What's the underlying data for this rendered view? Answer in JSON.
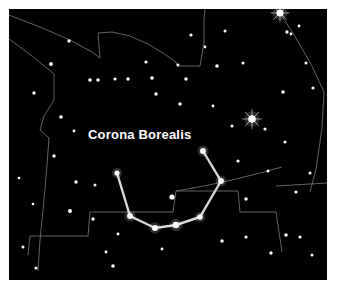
{
  "chart": {
    "title": "Corona Borealis",
    "type": "star-chart",
    "frame": {
      "background_color": "#ffffff",
      "sky_color": "#000000",
      "sky_left": 9,
      "sky_top": 9,
      "sky_width": 318,
      "sky_height": 271
    },
    "label": {
      "text": "Corona Borealis",
      "x": 88,
      "y": 128,
      "color": "#ffffff",
      "font_size": 13,
      "bold": true
    },
    "colors": {
      "star": "#ffffff",
      "constellation_line": "#d8d8d8",
      "boundary_line": "#6e6e6e",
      "sky": "#000000",
      "border": "#ffffff"
    },
    "constellation": {
      "name": "Corona Borealis",
      "line_color": "#d8d8d8",
      "line_width": 2.4,
      "stars": [
        {
          "name": "theta-crb",
          "x": 117,
          "y": 173,
          "r": 2.6
        },
        {
          "name": "beta-crb",
          "x": 130,
          "y": 216,
          "r": 2.9
        },
        {
          "name": "gamma-crb",
          "x": 155,
          "y": 228,
          "r": 3.0
        },
        {
          "name": "alpha-crb-alphecca",
          "x": 176,
          "y": 225,
          "r": 3.3
        },
        {
          "name": "delta-crb",
          "x": 200,
          "y": 217,
          "r": 2.8
        },
        {
          "name": "iota-crb",
          "x": 221,
          "y": 181,
          "r": 2.9
        },
        {
          "name": "epsilon-crb",
          "x": 203,
          "y": 151,
          "r": 2.9
        }
      ],
      "segments": [
        [
          0,
          1
        ],
        [
          1,
          2
        ],
        [
          2,
          3
        ],
        [
          3,
          4
        ],
        [
          4,
          5
        ],
        [
          5,
          6
        ]
      ]
    },
    "background_stars": [
      {
        "x": 280,
        "y": 13,
        "r": 3.6
      },
      {
        "x": 252,
        "y": 119,
        "r": 3.8
      },
      {
        "x": 172,
        "y": 197,
        "r": 2.6
      },
      {
        "x": 69,
        "y": 41,
        "r": 1.7
      },
      {
        "x": 191,
        "y": 35,
        "r": 1.6
      },
      {
        "x": 225,
        "y": 31,
        "r": 1.5
      },
      {
        "x": 205,
        "y": 47,
        "r": 1.4
      },
      {
        "x": 287,
        "y": 32,
        "r": 1.7
      },
      {
        "x": 299,
        "y": 26,
        "r": 1.4
      },
      {
        "x": 51,
        "y": 64,
        "r": 1.9
      },
      {
        "x": 90,
        "y": 80,
        "r": 1.8
      },
      {
        "x": 98,
        "y": 80,
        "r": 1.7
      },
      {
        "x": 115,
        "y": 79,
        "r": 1.6
      },
      {
        "x": 128,
        "y": 79,
        "r": 1.7
      },
      {
        "x": 146,
        "y": 62,
        "r": 1.6
      },
      {
        "x": 152,
        "y": 78,
        "r": 1.8
      },
      {
        "x": 156,
        "y": 94,
        "r": 1.7
      },
      {
        "x": 186,
        "y": 79,
        "r": 1.7
      },
      {
        "x": 178,
        "y": 65,
        "r": 1.4
      },
      {
        "x": 217,
        "y": 66,
        "r": 1.8
      },
      {
        "x": 243,
        "y": 63,
        "r": 1.5
      },
      {
        "x": 291,
        "y": 34,
        "r": 1.4
      },
      {
        "x": 306,
        "y": 63,
        "r": 1.5
      },
      {
        "x": 283,
        "y": 92,
        "r": 1.8
      },
      {
        "x": 313,
        "y": 88,
        "r": 1.6
      },
      {
        "x": 34,
        "y": 93,
        "r": 1.7
      },
      {
        "x": 61,
        "y": 117,
        "r": 1.8
      },
      {
        "x": 74,
        "y": 131,
        "r": 1.4
      },
      {
        "x": 180,
        "y": 104,
        "r": 1.7
      },
      {
        "x": 213,
        "y": 106,
        "r": 1.4
      },
      {
        "x": 232,
        "y": 126,
        "r": 1.5
      },
      {
        "x": 265,
        "y": 129,
        "r": 1.6
      },
      {
        "x": 285,
        "y": 142,
        "r": 1.5
      },
      {
        "x": 54,
        "y": 156,
        "r": 1.7
      },
      {
        "x": 76,
        "y": 182,
        "r": 1.7
      },
      {
        "x": 70,
        "y": 211,
        "r": 2.0
      },
      {
        "x": 93,
        "y": 219,
        "r": 1.7
      },
      {
        "x": 95,
        "y": 185,
        "r": 1.5
      },
      {
        "x": 118,
        "y": 234,
        "r": 1.4
      },
      {
        "x": 238,
        "y": 161,
        "r": 1.6
      },
      {
        "x": 268,
        "y": 171,
        "r": 1.5
      },
      {
        "x": 246,
        "y": 199,
        "r": 1.7
      },
      {
        "x": 296,
        "y": 192,
        "r": 1.6
      },
      {
        "x": 310,
        "y": 173,
        "r": 1.5
      },
      {
        "x": 222,
        "y": 241,
        "r": 1.7
      },
      {
        "x": 246,
        "y": 237,
        "r": 1.6
      },
      {
        "x": 286,
        "y": 235,
        "r": 1.8
      },
      {
        "x": 300,
        "y": 237,
        "r": 1.6
      },
      {
        "x": 271,
        "y": 253,
        "r": 1.7
      },
      {
        "x": 312,
        "y": 255,
        "r": 1.5
      },
      {
        "x": 113,
        "y": 266,
        "r": 1.8
      },
      {
        "x": 36,
        "y": 268,
        "r": 1.6
      },
      {
        "x": 23,
        "y": 247,
        "r": 1.5
      },
      {
        "x": 106,
        "y": 252,
        "r": 1.4
      },
      {
        "x": 162,
        "y": 249,
        "r": 1.4
      },
      {
        "x": 19,
        "y": 178,
        "r": 1.3
      },
      {
        "x": 33,
        "y": 204,
        "r": 1.3
      }
    ],
    "boundary_lines": [
      {
        "name": "north-boundary-arc-left",
        "points": "9,15 40,27 70,40 92,52 100,58 98,33 112,32 130,36 148,44 163,53 176,62 177,66"
      },
      {
        "name": "north-boundary-arc-right",
        "points": "177,66 200,66 204,43 204,20 205,9"
      },
      {
        "name": "northeast-diagonal",
        "points": "280,13 296,38 312,66 324,92"
      },
      {
        "name": "east-boundary",
        "points": "324,92 322,128 316,169 310,192"
      },
      {
        "name": "east-step",
        "points": "276,186 327,183"
      },
      {
        "name": "west-boundary",
        "points": "9,39 32,56 54,74 54,100 44,116 40,130 49,138 47,165 44,200 40,240 38,271"
      },
      {
        "name": "south-boundary-steps",
        "points": "28,255 30,236 88,236 90,212 173,212 176,191 238,191 240,212 276,212 282,252"
      },
      {
        "name": "south-arc",
        "points": "176,191 204,186 232,180 260,173 282,167"
      }
    ]
  }
}
